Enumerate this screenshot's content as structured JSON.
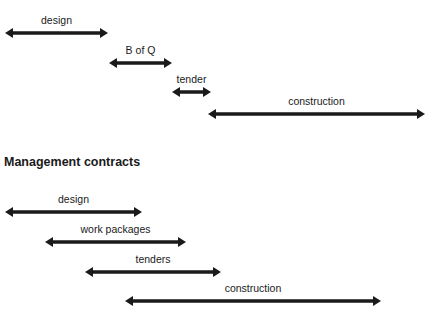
{
  "diagram": {
    "arrow_color": "#1a1a1a",
    "traditional": {
      "bars": [
        {
          "label": "design",
          "x1": 5,
          "x2": 108,
          "y": 33
        },
        {
          "label": "B of Q",
          "x1": 109,
          "x2": 172,
          "y": 63
        },
        {
          "label": "tender",
          "x1": 172,
          "x2": 211,
          "y": 92
        },
        {
          "label": "construction",
          "x1": 208,
          "x2": 425,
          "y": 114
        }
      ]
    },
    "management": {
      "heading": "Management contracts",
      "bars": [
        {
          "label": "design",
          "x1": 5,
          "x2": 142,
          "y": 212
        },
        {
          "label": "work packages",
          "x1": 45,
          "x2": 186,
          "y": 242
        },
        {
          "label": "tenders",
          "x1": 85,
          "x2": 221,
          "y": 272
        },
        {
          "label": "construction",
          "x1": 125,
          "x2": 381,
          "y": 301
        }
      ]
    }
  }
}
